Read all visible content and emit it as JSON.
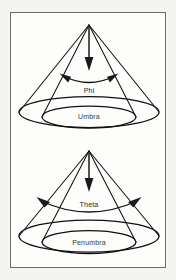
{
  "figure": {
    "background_color": "#f4f4f2",
    "panel_color": "#fdfdfc",
    "frame_color": "#6e6e6e",
    "ink_color": "#111111",
    "diagrams": [
      {
        "id": "umbra-cone",
        "angle_label": "Phi",
        "region_label": "Umbra",
        "axis_arrow": "downward-arrow",
        "arc": "double-headed-angle-arc"
      },
      {
        "id": "penumbra-cone",
        "angle_label": "Theta",
        "region_label": "Penumbra",
        "axis_arrow": "downward-arrow",
        "arc": "double-headed-angle-arc"
      }
    ]
  }
}
